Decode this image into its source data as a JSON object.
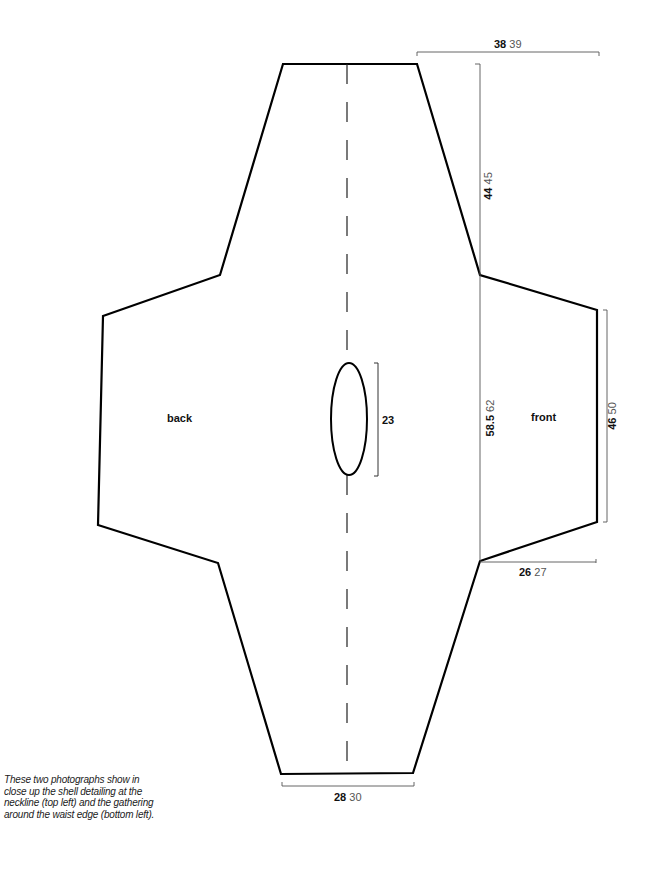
{
  "pieces": {
    "back": "back",
    "front": "front"
  },
  "dimensions": {
    "top_width": {
      "primary": "38",
      "secondary": "39"
    },
    "shoulder_length": {
      "primary": "44",
      "secondary": "45"
    },
    "body_length": {
      "primary": "58.5",
      "secondary": "62"
    },
    "neck_opening": {
      "primary": "23"
    },
    "sleeve_width": {
      "primary": "46",
      "secondary": "50"
    },
    "sleeve_depth": {
      "primary": "26",
      "secondary": "27"
    },
    "bottom_width": {
      "primary": "28",
      "secondary": "30"
    }
  },
  "caption": "These two photographs show in close up the shell detailing at the neckline (top left) and the gathering around the waist edge (bottom left).",
  "colors": {
    "outline": "#000000",
    "dimension_line": "#555555",
    "background": "#ffffff"
  }
}
